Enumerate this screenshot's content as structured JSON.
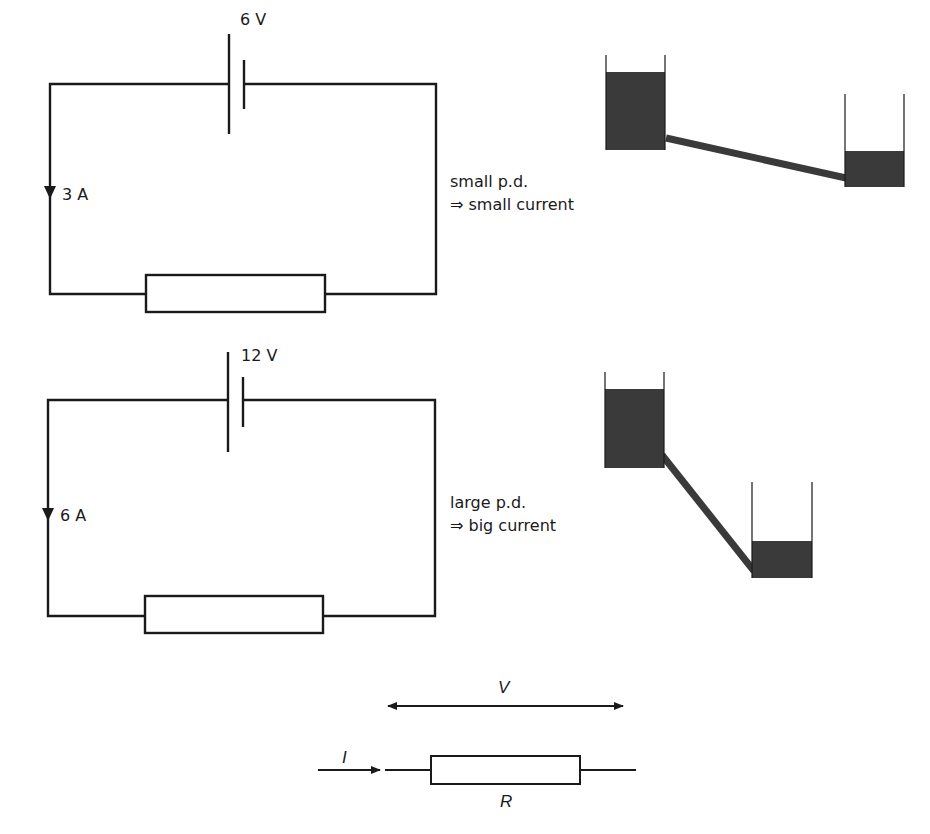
{
  "circuit_small": {
    "voltage_label": "6 V",
    "current_label": "3 A",
    "caption_line1": "small p.d.",
    "caption_line2": "⇒ small current"
  },
  "circuit_large": {
    "voltage_label": "12 V",
    "current_label": "6 A",
    "caption_line1": "large p.d.",
    "caption_line2": "⇒ big current"
  },
  "ohm_diagram": {
    "voltage_symbol": "V",
    "current_symbol": "I",
    "resistance_symbol": "R"
  },
  "colors": {
    "line": "#1a1a1a",
    "water": "#3a3a3a",
    "background": "#ffffff"
  }
}
